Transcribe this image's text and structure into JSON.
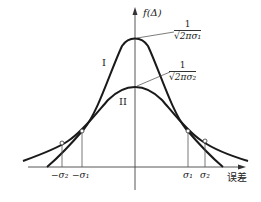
{
  "diagram": {
    "y_axis_label": "f(Δ)",
    "x_axis_label": "误差",
    "curves": [
      {
        "id": "I",
        "label": "I",
        "peak_label_num": "1",
        "peak_label_den": "√2πσ₁",
        "sigma": "σ1"
      },
      {
        "id": "II",
        "label": "II",
        "peak_label_num": "1",
        "peak_label_den": "√2πσ₂",
        "sigma": "σ2"
      }
    ],
    "ticks": {
      "neg_sigma2": "−σ₂",
      "neg_sigma1": "−σ₁",
      "sigma1": "σ₁",
      "sigma2": "σ₂"
    },
    "colors": {
      "stroke": "#1a1a1a",
      "axis": "#333333"
    }
  }
}
